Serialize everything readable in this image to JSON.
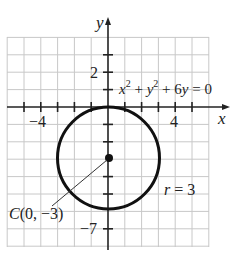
{
  "figure": {
    "equation": "x² + y² + 6y = 0",
    "axes": {
      "x_label": "x",
      "y_label": "y"
    },
    "tick_labels": {
      "x_neg": "−4",
      "x_pos": "4",
      "y_pos": "2",
      "y_neg": "−7"
    },
    "center_label": "C(0, −3)",
    "radius_label": "r = 3",
    "circle": {
      "center": [
        0,
        -3
      ],
      "radius": 3
    },
    "grid": {
      "x_range": [
        -6,
        6
      ],
      "y_range": [
        -8,
        4
      ]
    },
    "colors": {
      "grid": "#c8c8c8",
      "axis": "#222222",
      "circle": "#111111"
    }
  }
}
